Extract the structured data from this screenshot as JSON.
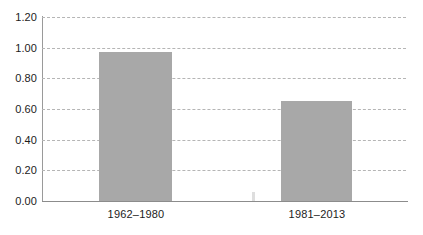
{
  "chart_data": {
    "type": "bar",
    "title": "",
    "subtitle": "",
    "xlabel": "",
    "ylabel": "",
    "categories": [
      "1962–1980",
      "1981–2013"
    ],
    "values": [
      0.97,
      0.65
    ],
    "series": [
      {
        "name": "",
        "values": [
          0.97,
          0.65
        ]
      }
    ],
    "ylim": [
      0.0,
      1.2
    ],
    "ytick_values": [
      1.2,
      1.0,
      0.8,
      0.6,
      0.4,
      0.2,
      0.0
    ],
    "ytick_labels": [
      "1.20",
      "1.00",
      "0.80",
      "0.60",
      "0.40",
      "0.20",
      "0.00"
    ],
    "grid": true,
    "grid_axis": "y",
    "grid_style": "dashed",
    "legend": false,
    "legend_position": "none",
    "annotations": [],
    "colors": {
      "bar_fill": "#a8a8a8",
      "gridline": "#b5b5b5",
      "axis_line": "#8c8c8c",
      "text": "#1c1c1c",
      "background": "#ffffff"
    }
  }
}
